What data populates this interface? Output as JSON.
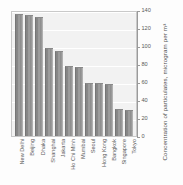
{
  "chart_data": {
    "type": "bar",
    "title": "",
    "subtitle": "",
    "xlabel": "",
    "ylabel": "Concentration of particulates, microgram per m³",
    "ylim": [
      0,
      140
    ],
    "yticks": [
      0,
      20,
      40,
      60,
      80,
      100,
      120,
      140
    ],
    "grid": true,
    "legend": "none",
    "orientation": "vertical",
    "categories": [
      "New Delhi",
      "Beijing",
      "Dhaka",
      "Shanghai",
      "Jakarta",
      "Ho Chi Minh",
      "Mumbai",
      "Seoul",
      "Hong Kong",
      "Bangkok",
      "Singapore",
      "Tokyo"
    ],
    "values": [
      136,
      135,
      132,
      98,
      94,
      78,
      77,
      59,
      59,
      58,
      30,
      29
    ],
    "units": "microgram per m³"
  },
  "axis": {
    "tick_labels": [
      "0",
      "20",
      "40",
      "60",
      "80",
      "100",
      "120",
      "140"
    ],
    "title": "Concentration of particulates, microgram per m³"
  },
  "colors": {
    "bar_fill": "#8f8f8f",
    "bar_edge": "#757575",
    "plot_background": "#f2f2f2",
    "gridline": "#ffffff",
    "axis_line": "#9a9a9a",
    "text": "#5a5a5a",
    "page_background": "#fdfdfd"
  }
}
